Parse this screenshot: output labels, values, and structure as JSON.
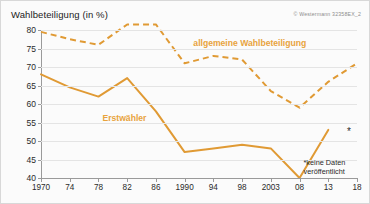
{
  "chart": {
    "title": "Wahlbeteiligung (in %)",
    "credit": "© Westermann  32358EX_2",
    "footnote_line1": "*keine Daten",
    "footnote_line2": "veröffentlicht",
    "missing_marker": "*",
    "label_general": "allgemeine Wahlbeteiligung",
    "label_firstvoters": "Erstwähler",
    "accent_color": "#e8a33d",
    "line_color": "#e09a34"
  },
  "chart_data": {
    "type": "line",
    "title": "Wahlbeteiligung (in %)",
    "xlabel": "",
    "ylabel": "Wahlbeteiligung (in %)",
    "ylim": [
      40,
      80
    ],
    "yticks": [
      40,
      45,
      50,
      55,
      60,
      65,
      70,
      75,
      80
    ],
    "grid": true,
    "legend": "inline-annotations",
    "categories": [
      "1970",
      "74",
      "78",
      "82",
      "86",
      "1990",
      "94",
      "98",
      "2003",
      "08",
      "13",
      "18"
    ],
    "series": [
      {
        "name": "allgemeine Wahlbeteiligung",
        "style": "dashed",
        "values": [
          79.5,
          77.5,
          76,
          81.5,
          81.5,
          71,
          73,
          72,
          63.5,
          59,
          66,
          71
        ]
      },
      {
        "name": "Erstwähler",
        "style": "solid",
        "values": [
          68,
          64.5,
          62,
          67,
          58,
          47,
          48,
          49,
          48,
          40,
          53,
          null
        ]
      }
    ],
    "annotations": [
      {
        "text": "*keine Daten veröffentlicht",
        "note": "Erstwähler 2018 nicht verfügbar"
      }
    ]
  }
}
